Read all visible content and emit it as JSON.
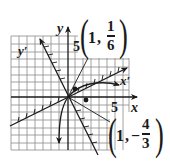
{
  "diagram": {
    "type": "rotated-axes-hyperbola",
    "colors": {
      "ink": "#1a1a1a",
      "grid": "#7a7a7a",
      "background": "#ffffff"
    },
    "axes": {
      "x_label": "x",
      "y_label": "y",
      "x_prime_label": "x′",
      "y_prime_label": "y′",
      "x_tick_label": "5",
      "y_tick_label": "5"
    },
    "points": [
      {
        "label_x": "1",
        "label_y_num": "1",
        "label_y_den": "6",
        "label_y_sign": "",
        "comma": ","
      },
      {
        "label_x": "1",
        "label_y_num": "4",
        "label_y_den": "3",
        "label_y_sign": "−",
        "comma": ","
      }
    ]
  }
}
